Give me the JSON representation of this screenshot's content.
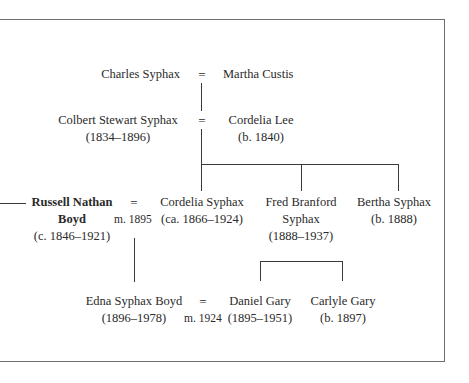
{
  "diagram": {
    "type": "family-tree",
    "marriage_symbol": "=",
    "generations": [
      {
        "couple": {
          "spouse_a": {
            "name": "Charles Syphax"
          },
          "spouse_b": {
            "name": "Martha Custis"
          }
        }
      },
      {
        "couple": {
          "spouse_a": {
            "name": "Colbert Stewart Syphax",
            "dates": "(1834–1896)"
          },
          "spouse_b": {
            "name": "Cordelia Lee",
            "dates": "(b. 1840)"
          }
        }
      },
      {
        "couple": {
          "spouse_a": {
            "name_line1": "Russell Nathan",
            "name_line2": "Boyd",
            "dates": "(c. 1846–1921)",
            "bold": true
          },
          "marriage": "m. 1895",
          "spouse_b": {
            "name": "Cordelia Syphax",
            "dates": "(ca. 1866–1924)"
          }
        },
        "siblings": [
          {
            "name_line1": "Fred Branford",
            "name_line2": "Syphax",
            "dates": "(1888–1937)"
          },
          {
            "name": "Bertha Syphax",
            "dates": "(b. 1888)"
          }
        ]
      },
      {
        "couple": {
          "spouse_a": {
            "name": "Edna Syphax Boyd",
            "dates": "(1896–1978)"
          },
          "marriage": "m. 1924",
          "spouse_b": {
            "name": "Daniel Gary",
            "dates": "(1895–1951)"
          }
        },
        "siblings": [
          {
            "name": "Carlyle Gary",
            "dates": "(b. 1897)"
          }
        ]
      }
    ]
  }
}
